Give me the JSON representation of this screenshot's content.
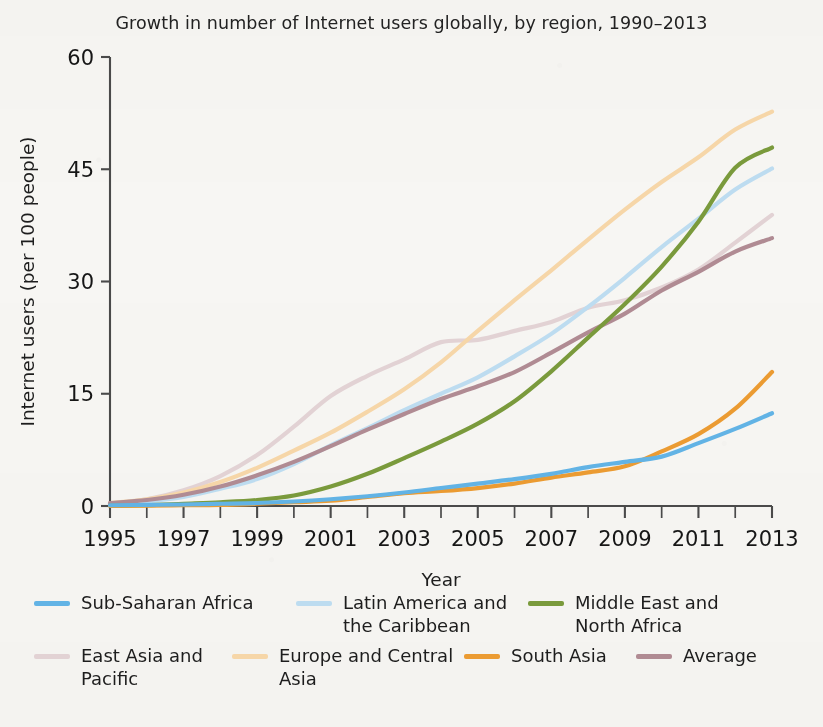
{
  "chart_data": {
    "type": "line",
    "title": "Growth in number of Internet users globally, by region, 1990–2013",
    "xlabel": "Year",
    "ylabel": "Internet users (per 100 people)",
    "xlim": [
      1995,
      2013
    ],
    "ylim": [
      0,
      60
    ],
    "xticks": [
      "1995",
      "1997",
      "1999",
      "2001",
      "2003",
      "2005",
      "2007",
      "2009",
      "2011",
      "2013"
    ],
    "yticks": [
      "0",
      "15",
      "30",
      "45",
      "60"
    ],
    "minor_xticks": true,
    "grid": false,
    "legend_position": "below",
    "background_color": "#f7f6f3",
    "x": [
      1995,
      1996,
      1997,
      1998,
      1999,
      2000,
      2001,
      2002,
      2003,
      2004,
      2005,
      2006,
      2007,
      2008,
      2009,
      2010,
      2011,
      2012,
      2013
    ],
    "series": [
      {
        "name": "Sub-Saharan Africa",
        "color": "#62b3e5",
        "values": [
          0.1,
          0.15,
          0.2,
          0.3,
          0.4,
          0.6,
          0.9,
          1.3,
          1.8,
          2.4,
          3.0,
          3.6,
          4.3,
          5.2,
          5.9,
          6.6,
          8.4,
          10.3,
          12.4
        ]
      },
      {
        "name": "Latin America and\nthe Caribbean",
        "color": "#bddcf0",
        "values": [
          0.3,
          0.6,
          1.2,
          2.3,
          3.6,
          5.6,
          8.1,
          10.4,
          12.8,
          15.0,
          17.2,
          20.0,
          23.0,
          26.6,
          30.5,
          34.6,
          38.4,
          42.3,
          45.1
        ]
      },
      {
        "name": "Middle East and\nNorth Africa",
        "color": "#7a9a3c",
        "values": [
          0.05,
          0.1,
          0.3,
          0.5,
          0.8,
          1.4,
          2.6,
          4.3,
          6.4,
          8.6,
          11.0,
          14.0,
          18.0,
          22.5,
          27.0,
          32.0,
          38.0,
          45.2,
          47.9
        ]
      },
      {
        "name": "East Asia and\nPacific",
        "color": "#e2d2d4",
        "values": [
          0.3,
          0.9,
          2.1,
          4.0,
          6.8,
          10.6,
          14.7,
          17.4,
          19.6,
          21.9,
          22.2,
          23.4,
          24.6,
          26.5,
          27.5,
          29.2,
          31.6,
          35.2,
          38.9
        ]
      },
      {
        "name": "Europe and Central\nAsia",
        "color": "#f6d6a8",
        "values": [
          0.4,
          0.9,
          1.8,
          3.2,
          5.1,
          7.4,
          9.8,
          12.6,
          15.6,
          19.2,
          23.4,
          27.5,
          31.5,
          35.6,
          39.6,
          43.3,
          46.6,
          50.3,
          52.7
        ]
      },
      {
        "name": "South Asia",
        "color": "#eb9b32",
        "values": [
          0.03,
          0.05,
          0.1,
          0.15,
          0.3,
          0.5,
          0.7,
          1.2,
          1.7,
          2.0,
          2.4,
          3.0,
          3.8,
          4.5,
          5.3,
          7.3,
          9.6,
          13.0,
          17.9
        ]
      },
      {
        "name": "Average",
        "color": "#b08b93",
        "values": [
          0.4,
          0.8,
          1.5,
          2.6,
          4.1,
          5.9,
          8.0,
          10.2,
          12.3,
          14.3,
          16.0,
          17.9,
          20.5,
          23.2,
          25.7,
          28.8,
          31.3,
          34.0,
          35.8
        ]
      }
    ]
  },
  "legend": {
    "rows": [
      [
        {
          "label": "Sub-Saharan Africa",
          "color": "#62b3e5",
          "width": 262
        },
        {
          "label": "Latin America and\nthe Caribbean",
          "color": "#bddcf0",
          "width": 232
        },
        {
          "label": "Middle East and\nNorth Africa",
          "color": "#7a9a3c",
          "width": 240
        }
      ],
      [
        {
          "label": "East Asia and\nPacific",
          "color": "#e2d2d4",
          "width": 198
        },
        {
          "label": "Europe and Central\nAsia",
          "color": "#f6d6a8",
          "width": 232
        },
        {
          "label": "South Asia",
          "color": "#eb9b32",
          "width": 172
        },
        {
          "label": "Average",
          "color": "#b08b93",
          "width": 150
        }
      ]
    ]
  }
}
